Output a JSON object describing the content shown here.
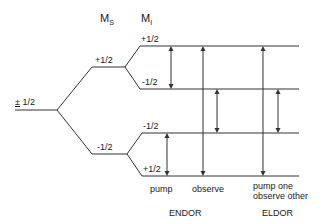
{
  "headers": {
    "ms": {
      "main": "M",
      "sub": "S"
    },
    "mi": {
      "main": "M",
      "sub": "I"
    }
  },
  "levels": {
    "root": {
      "label": "± 1/2",
      "pm_char": "±",
      "rest": " 1/2"
    },
    "ms_upper": "+1/2",
    "ms_lower": "-1/2",
    "mi_upper_top": "+1/2",
    "mi_upper_bottom": "-1/2",
    "mi_lower_top": "-1/2",
    "mi_lower_bottom": "+1/2"
  },
  "transitions": {
    "endor_pump": "pump",
    "endor_observe": "observe",
    "eldor_line1": "pump one",
    "eldor_line2": "observe other"
  },
  "groups": {
    "endor": "ENDOR",
    "eldor": "ELDOR"
  },
  "colors": {
    "line": "#333333",
    "text": "#1a1a1a",
    "background": "#ffffff"
  }
}
